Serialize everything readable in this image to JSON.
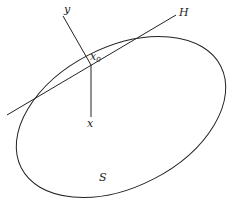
{
  "diagram": {
    "labels": {
      "y_axis": "y",
      "x_axis": "x",
      "point": "x",
      "point_subscript": "0",
      "hyperplane": "H",
      "surface": "S"
    },
    "colors": {
      "stroke": "#222222",
      "background": "#ffffff"
    }
  }
}
